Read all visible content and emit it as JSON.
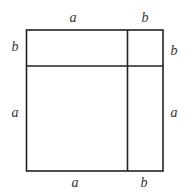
{
  "diagram": {
    "title": "",
    "colors": {
      "stroke": "#222222",
      "text": "#333333",
      "background": "#ffffff"
    },
    "labels": {
      "top": [
        "a",
        "b"
      ],
      "left": [
        "b",
        "a"
      ],
      "right": [
        "b",
        "a"
      ],
      "bottom": [
        "a",
        "b"
      ]
    },
    "regions": [
      {
        "name": "top-left",
        "dims": "a × b"
      },
      {
        "name": "top-right",
        "dims": "b × b"
      },
      {
        "name": "bottom-left",
        "dims": "a × a"
      },
      {
        "name": "bottom-right",
        "dims": "b × a"
      }
    ]
  }
}
